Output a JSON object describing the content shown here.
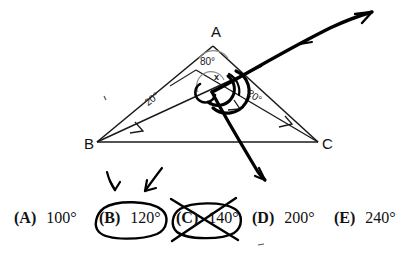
{
  "figure": {
    "type": "geometry-diagram",
    "vertices": [
      {
        "name": "vertex-label-A",
        "label": "A",
        "x": 211,
        "y": 24
      },
      {
        "name": "vertex-label-B",
        "label": "B",
        "x": 84,
        "y": 136
      },
      {
        "name": "vertex-label-C",
        "label": "C",
        "x": 322,
        "y": 136
      }
    ],
    "angle_labels": [
      {
        "name": "angle-label-apex",
        "label": "80°",
        "x": 200,
        "y": 57
      },
      {
        "name": "angle-label-left",
        "label": "20°",
        "x": 143,
        "y": 100
      },
      {
        "name": "angle-label-right",
        "label": "20°",
        "x": 251,
        "y": 88
      },
      {
        "name": "angle-label-x",
        "label": "x",
        "x": 214,
        "y": 73
      }
    ],
    "colors": {
      "stroke": "#1a1a1a",
      "pen": "#000000",
      "background": "#ffffff",
      "faint_arc": "#8a8a8a"
    }
  },
  "choices": [
    {
      "tag": "(A)",
      "value": "100°",
      "x": 14,
      "circled": false,
      "crossed": false
    },
    {
      "tag": "(B)",
      "value": "120°",
      "x": 99,
      "circled": true,
      "crossed": false
    },
    {
      "tag": "(C)",
      "value": "140°",
      "x": 176,
      "circled": true,
      "crossed": true
    },
    {
      "tag": "(D)",
      "value": "200°",
      "x": 252,
      "circled": false,
      "crossed": false
    },
    {
      "tag": "(E)",
      "value": "240°",
      "x": 334,
      "circled": false,
      "crossed": false
    }
  ]
}
